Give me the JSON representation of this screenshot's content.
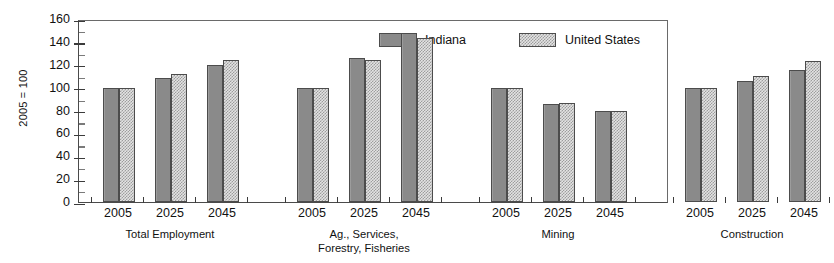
{
  "chart_data": {
    "type": "bar",
    "title": "",
    "subtitle": "",
    "xlabel": "",
    "ylabel": "2005 = 100",
    "ylim": [
      0,
      160
    ],
    "ytick_step": 20,
    "yticks": [
      0,
      20,
      40,
      60,
      80,
      100,
      120,
      140,
      160
    ],
    "minor_ticks": true,
    "grid": false,
    "legend_position": "top-right-inside",
    "categories": [
      "2005",
      "2025",
      "2045"
    ],
    "groups": [
      {
        "label": "Total Employment",
        "label_lines": [
          "Total Employment"
        ],
        "categories": [
          "2005",
          "2025",
          "2045"
        ],
        "series": [
          {
            "name": "Indiana",
            "values": [
              100,
              108,
              120
            ]
          },
          {
            "name": "United States",
            "values": [
              100,
              112,
              124
            ]
          }
        ]
      },
      {
        "label": "Ag., Services, Forestry, Fisheries",
        "label_lines": [
          "Ag., Services,",
          "Forestry, Fisheries"
        ],
        "categories": [
          "2005",
          "2025",
          "2045"
        ],
        "series": [
          {
            "name": "Indiana",
            "values": [
              100,
              126,
              148
            ]
          },
          {
            "name": "United States",
            "values": [
              100,
              124,
              143
            ]
          }
        ]
      },
      {
        "label": "Mining",
        "label_lines": [
          "Mining"
        ],
        "categories": [
          "2005",
          "2025",
          "2045"
        ],
        "series": [
          {
            "name": "Indiana",
            "values": [
              100,
              86,
              80
            ]
          },
          {
            "name": "United States",
            "values": [
              100,
              87,
              80
            ]
          }
        ]
      },
      {
        "label": "Construction",
        "label_lines": [
          "Construction"
        ],
        "categories": [
          "2005",
          "2025",
          "2045"
        ],
        "series": [
          {
            "name": "Indiana",
            "values": [
              100,
              106,
              115
            ]
          },
          {
            "name": "United States",
            "values": [
              100,
              110,
              123
            ]
          }
        ]
      }
    ],
    "series_styles": [
      {
        "name": "Indiana",
        "fill": "#8a8a8a",
        "pattern": "solid-gray",
        "border": "#4c4c4c"
      },
      {
        "name": "United States",
        "fill": "#e3e3e3",
        "pattern": "checkerboard",
        "border": "#4c4c4c"
      }
    ]
  },
  "legend": {
    "items": [
      {
        "label": "Indiana",
        "swatch": "indiana"
      },
      {
        "label": "United States",
        "swatch": "us"
      }
    ]
  },
  "axis": {
    "y_title": "2005 = 100"
  },
  "colors": {
    "indiana": "#8a8a8a",
    "united_states": "#e3e3e3",
    "axis": "#3b3b3b",
    "frame": "#6a6a6a",
    "background": "#ffffff"
  }
}
